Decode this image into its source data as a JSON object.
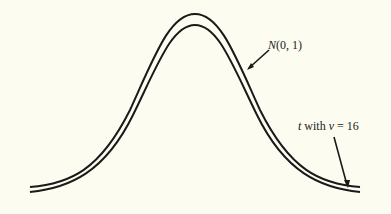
{
  "figure": {
    "curves": [
      {
        "id": "normal",
        "label_italic": "N",
        "label_rest": "(0, 1)",
        "peak_y": 14
      },
      {
        "id": "t16",
        "label_italic_t": "t",
        "label_mid": " with ",
        "label_italic_v": "v",
        "label_rest": " = 16",
        "peak_y": 25
      }
    ],
    "colors": {
      "background": "#fdfcf1",
      "curve": "#1a1a1a",
      "baseline_start": "#333333",
      "baseline_mid_red": "#c0506a",
      "baseline_mid_green": "#60c080",
      "baseline_end": "#a08a8a"
    }
  }
}
